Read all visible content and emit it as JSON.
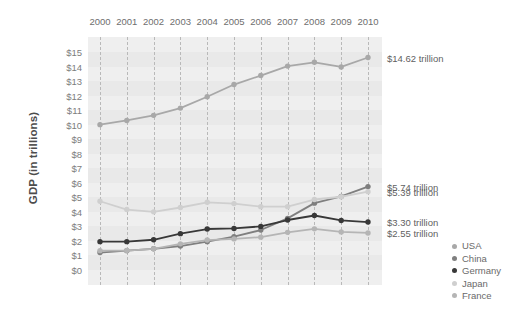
{
  "chart_data": {
    "type": "line",
    "title": "",
    "xlabel": "",
    "ylabel": "GDP (in trillions)",
    "x": [
      2000,
      2001,
      2002,
      2003,
      2004,
      2005,
      2006,
      2007,
      2008,
      2009,
      2010
    ],
    "categories": [
      "2000",
      "2001",
      "2002",
      "2003",
      "2004",
      "2005",
      "2006",
      "2007",
      "2008",
      "2009",
      "2010"
    ],
    "ylim": [
      0,
      15
    ],
    "ytick_labels": [
      "$15",
      "$14",
      "$13",
      "$12",
      "$11",
      "$10",
      "$9",
      "$8",
      "$7",
      "$6",
      "$5",
      "$4",
      "$3",
      "$2",
      "$1",
      "$0"
    ],
    "ytick_values": [
      15,
      14,
      13,
      12,
      11,
      10,
      9,
      8,
      7,
      6,
      5,
      4,
      3,
      2,
      1,
      0
    ],
    "grid": "vertical-dashed",
    "legend_position": "right",
    "series": [
      {
        "name": "USA",
        "color": "#a8a8a8",
        "values": [
          10.0,
          10.29,
          10.64,
          11.14,
          11.92,
          12.76,
          13.38,
          14.03,
          14.29,
          13.97,
          14.62
        ],
        "end_label": "$14.62 trillion"
      },
      {
        "name": "China",
        "color": "#7f7f7f",
        "values": [
          1.2,
          1.33,
          1.46,
          1.65,
          1.95,
          2.29,
          2.75,
          3.55,
          4.6,
          5.06,
          5.74
        ],
        "end_label": "$5.74 trillion"
      },
      {
        "name": "Germany",
        "color": "#383838",
        "values": [
          1.95,
          1.95,
          2.08,
          2.5,
          2.82,
          2.86,
          3.0,
          3.44,
          3.75,
          3.41,
          3.3
        ],
        "end_label": "$3.30 trillion"
      },
      {
        "name": "Japan",
        "color": "#cfcfcf",
        "values": [
          4.73,
          4.16,
          4.0,
          4.3,
          4.66,
          4.57,
          4.36,
          4.36,
          4.85,
          5.04,
          5.39
        ],
        "end_label": "$5.39 trillion"
      },
      {
        "name": "France",
        "color": "#b5b5b5",
        "values": [
          1.33,
          1.34,
          1.46,
          1.8,
          2.06,
          2.14,
          2.26,
          2.59,
          2.83,
          2.62,
          2.55
        ],
        "end_label": "$2.55 trillion"
      }
    ],
    "annotations": [
      {
        "text": "$14.62 trillion",
        "series": "USA",
        "value": 14.62
      },
      {
        "text": "$5.74 trillion",
        "series": "China",
        "value": 5.74
      },
      {
        "text": "$5.39 trillion",
        "series": "Japan",
        "value": 5.39
      },
      {
        "text": "$3.30 trillion",
        "series": "Germany",
        "value": 3.3
      },
      {
        "text": "$2.55 trillion",
        "series": "France",
        "value": 2.55
      }
    ]
  },
  "legend": {
    "items": [
      {
        "label": "USA",
        "color": "#a8a8a8"
      },
      {
        "label": "China",
        "color": "#7f7f7f"
      },
      {
        "label": "Germany",
        "color": "#383838"
      },
      {
        "label": "Japan",
        "color": "#cfcfcf"
      },
      {
        "label": "France",
        "color": "#b5b5b5"
      }
    ]
  }
}
